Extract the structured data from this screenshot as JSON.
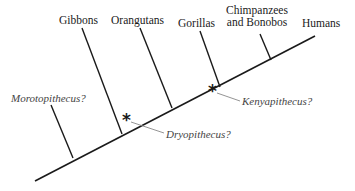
{
  "diagram": {
    "type": "phylogenetic-tree",
    "taxa": [
      {
        "label": "Gibbons"
      },
      {
        "label": "Orangutans"
      },
      {
        "label": "Gorillas"
      },
      {
        "label_line1": "Chimpanzees",
        "label_line2": "and Bonobos"
      },
      {
        "label": "Humans"
      }
    ],
    "fossils": [
      {
        "label": "Morotopithecus?",
        "marker": "branch"
      },
      {
        "label": "Dryopithecus?",
        "marker": "asterisk"
      },
      {
        "label": "Kenyapithecus?",
        "marker": "asterisk"
      }
    ],
    "marker_glyph": "*",
    "colors": {
      "line": "#1a1a1a",
      "leader": "#888888",
      "fossil_text": "#444444"
    }
  }
}
